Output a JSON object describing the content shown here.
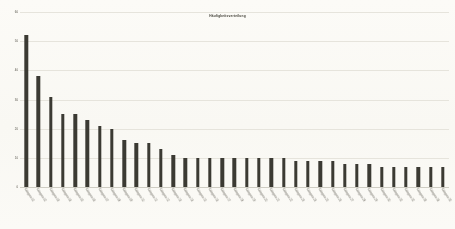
{
  "chart_data": {
    "type": "bar",
    "title": "Häufigkeitsverteilung",
    "xlabel": "",
    "ylabel": "",
    "ylim": [
      0,
      60
    ],
    "grid": true,
    "legend": null,
    "bar_color": "#3b3a33",
    "background_color": "#fbfaf6",
    "gridline_color": "#e6e4dc",
    "yticks": [
      0,
      10,
      20,
      30,
      40,
      50,
      60
    ],
    "ytick_labels": [
      "0",
      "10",
      "20",
      "30",
      "40",
      "50",
      "60"
    ],
    "categories": [
      "Kategorie 01",
      "Kategorie 02",
      "Kategorie 03",
      "Kategorie 04",
      "Kategorie 05",
      "Kategorie 06",
      "Kategorie 07",
      "Kategorie 08",
      "Kategorie 09",
      "Kategorie 10",
      "Kategorie 11",
      "Kategorie 12",
      "Kategorie 13",
      "Kategorie 14",
      "Kategorie 15",
      "Kategorie 16",
      "Kategorie 17",
      "Kategorie 18",
      "Kategorie 19",
      "Kategorie 20",
      "Kategorie 21",
      "Kategorie 22",
      "Kategorie 23",
      "Kategorie 24",
      "Kategorie 25",
      "Kategorie 26",
      "Kategorie 27",
      "Kategorie 28",
      "Kategorie 29",
      "Kategorie 30",
      "Kategorie 31",
      "Kategorie 32",
      "Kategorie 33",
      "Kategorie 34",
      "Kategorie 35"
    ],
    "values": [
      52,
      38,
      31,
      25,
      25,
      23,
      21,
      20,
      16,
      15,
      15,
      13,
      11,
      10,
      10,
      10,
      10,
      10,
      10,
      10,
      10,
      10,
      9,
      9,
      9,
      9,
      8,
      8,
      8,
      7,
      7,
      7,
      7,
      7,
      7
    ]
  }
}
